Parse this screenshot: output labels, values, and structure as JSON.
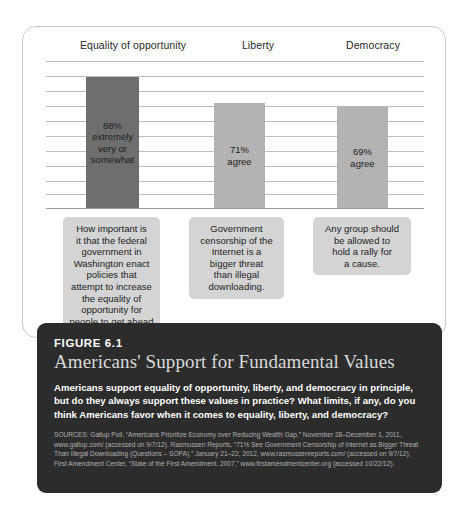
{
  "figure": {
    "number": "FIGURE 6.1",
    "title": "Americans' Support for Fundamental Values",
    "body": "Americans support equality of opportunity, liberty, and democracy in principle, but do they always support these values in practice? What limits, if any, do you think Americans favor when it comes to equality, liberty, and democracy?",
    "sources": "SOURCES: Gallup Poll, “Americans Prioritize Economy over Reducing Wealth Gap,” November 28–December 1, 2011, www.gallup.com/ (accessed on 9/7/12). Rasmussen Reports, “71% See Government Censorship of Internet as Bigger Threat Than Illegal Downloading (Questions – SOPA),” January 21–22, 2012, www.rasmussenreports.com/ (accessed on 9/7/12); First Amendment Center, “State of the First Amendment, 2007,” www.firstamendmentcenter.org (accessed 10/22/12)."
  },
  "colors": {
    "bar_highlight": "#6e6e6e",
    "bar_default": "#b3b3b3",
    "callout_bg": "#d4d4d4",
    "panel_bg": "#2c2c2c",
    "gridline": "#bdbdbd"
  },
  "chart_data": {
    "type": "bar",
    "title": "Americans' Support for Fundamental Values",
    "xlabel": "",
    "ylabel": "",
    "ylim": [
      0,
      100
    ],
    "grid": true,
    "legend": "none",
    "categories": [
      "Equality of opportunity",
      "Liberty",
      "Democracy"
    ],
    "values": [
      88,
      71,
      69
    ],
    "bar_labels": [
      "88% extremely very or somewhat",
      "71% agree",
      "69% agree"
    ],
    "bar_label_lines": [
      [
        "88%",
        "extremely",
        "very or",
        "somewhat"
      ],
      [
        "71%",
        "agree"
      ],
      [
        "69%",
        "agree"
      ]
    ],
    "bar_colors": [
      "#6e6e6e",
      "#b3b3b3",
      "#b3b3b3"
    ],
    "annotations": [
      "How important is it that the federal government in Washington enact policies that attempt to increase the equality of opportunity for people to get ahead if they want to?",
      "Government censorship of the Internet is a bigger threat than illegal downloading.",
      "Any group should be allowed to hold a rally for a cause."
    ]
  },
  "callouts": [
    {
      "lines": [
        "How important is",
        "it that the federal",
        "government in",
        "Washington enact",
        "policies that",
        "attempt to increase",
        "the equality of",
        "opportunity for",
        "people to get ahead",
        "if they want to?"
      ]
    },
    {
      "lines": [
        "Government",
        "censorship of the",
        "Internet is a",
        "bigger threat",
        "than illegal",
        "downloading."
      ]
    },
    {
      "lines": [
        "Any group should",
        "be allowed to",
        "hold a rally for",
        "a cause."
      ]
    }
  ]
}
